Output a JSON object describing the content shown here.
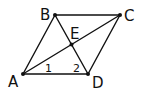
{
  "diagram": {
    "type": "geometry",
    "shape": "parallelogram",
    "colors": {
      "stroke": "#111111",
      "background": "#ffffff"
    },
    "vertices": {
      "A": {
        "label": "A",
        "x": 23,
        "y": 74
      },
      "B": {
        "label": "B",
        "x": 55,
        "y": 15
      },
      "C": {
        "label": "C",
        "x": 120,
        "y": 15
      },
      "D": {
        "label": "D",
        "x": 88,
        "y": 74
      },
      "E": {
        "label": "E",
        "x": 71.5,
        "y": 44.5
      }
    },
    "segments": [
      "AB",
      "BC",
      "CD",
      "DA",
      "AC",
      "BD"
    ],
    "angle_labels": {
      "angle1": {
        "label": "1",
        "at": "A",
        "between": [
          "AD",
          "AC"
        ]
      },
      "angle2": {
        "label": "2",
        "at": "D",
        "between": [
          "DA",
          "DB"
        ]
      }
    }
  }
}
